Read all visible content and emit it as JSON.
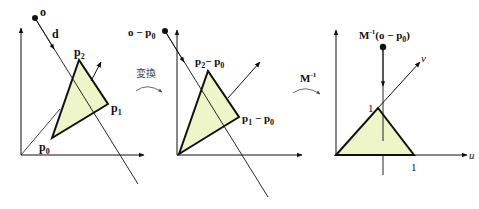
{
  "panels": [
    {
      "name": "world-space",
      "labels": {
        "origin": "o",
        "direction": "d",
        "p0": "p",
        "p0_sub": "0",
        "p1": "p",
        "p1_sub": "1",
        "p2": "p",
        "p2_sub": "2"
      }
    },
    {
      "name": "translated",
      "labels": {
        "origin": "o − p",
        "origin_sub": "0",
        "p1": "p",
        "p1_sub": "1",
        "p1_minus": " − p",
        "p1_minus_sub": "0",
        "p2": "p",
        "p2_sub": "2",
        "p2_minus": "− p",
        "p2_minus_sub": "0"
      }
    },
    {
      "name": "barycentric",
      "labels": {
        "origin": "M",
        "origin_sup": "-1",
        "origin_rest": "(o − p",
        "origin_sub": "0",
        "origin_close": ")",
        "u_axis": "u",
        "v_axis": "v",
        "one_u": "1",
        "one_v": "1"
      }
    }
  ],
  "transitions": [
    {
      "label": "変換"
    },
    {
      "label": "M",
      "sup": "-1"
    }
  ],
  "colors": {
    "triangle_fill": "#eef5c8",
    "stroke": "#111111"
  }
}
